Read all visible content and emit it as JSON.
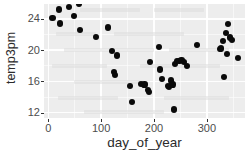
{
  "chart_data": {
    "type": "scatter",
    "title": "",
    "xlabel": "day_of_year",
    "ylabel": "temp3pm",
    "xlim": [
      -8,
      372
    ],
    "ylim": [
      11.3,
      25.9
    ],
    "xticks": [
      0,
      100,
      200,
      300
    ],
    "xtick_labels": [
      "0",
      "100",
      "200",
      "300"
    ],
    "yticks": [
      12,
      16,
      20,
      24
    ],
    "ytick_labels": [
      "12",
      "16",
      "20",
      "24"
    ],
    "grid": true,
    "grid_color": "#ffffff",
    "panel_background": "#ededed",
    "point_color": "#000000",
    "legend": null,
    "points": [
      {
        "x": 8,
        "y": 24.1
      },
      {
        "x": 20,
        "y": 25.2
      },
      {
        "x": 22,
        "y": 23.4
      },
      {
        "x": 40,
        "y": 25.5
      },
      {
        "x": 48,
        "y": 24.4
      },
      {
        "x": 58,
        "y": 25.9
      },
      {
        "x": 60,
        "y": 22.6
      },
      {
        "x": 90,
        "y": 21.7
      },
      {
        "x": 113,
        "y": 22.9
      },
      {
        "x": 120,
        "y": 19.9
      },
      {
        "x": 124,
        "y": 17.2
      },
      {
        "x": 126,
        "y": 16.8
      },
      {
        "x": 130,
        "y": 19.3
      },
      {
        "x": 155,
        "y": 15.4
      },
      {
        "x": 158,
        "y": 13.3
      },
      {
        "x": 175,
        "y": 15.7
      },
      {
        "x": 182,
        "y": 15.6
      },
      {
        "x": 188,
        "y": 14.9
      },
      {
        "x": 190,
        "y": 14.6
      },
      {
        "x": 193,
        "y": 18.5
      },
      {
        "x": 210,
        "y": 20.4
      },
      {
        "x": 212,
        "y": 17.5
      },
      {
        "x": 215,
        "y": 16.3
      },
      {
        "x": 226,
        "y": 15.4
      },
      {
        "x": 229,
        "y": 15.3
      },
      {
        "x": 232,
        "y": 16.1
      },
      {
        "x": 235,
        "y": 15.6
      },
      {
        "x": 238,
        "y": 12.4
      },
      {
        "x": 240,
        "y": 18.2
      },
      {
        "x": 244,
        "y": 18.6
      },
      {
        "x": 248,
        "y": 18.6
      },
      {
        "x": 252,
        "y": 18.7
      },
      {
        "x": 256,
        "y": 18.5
      },
      {
        "x": 262,
        "y": 18.0
      },
      {
        "x": 281,
        "y": 20.6
      },
      {
        "x": 324,
        "y": 20.1
      },
      {
        "x": 327,
        "y": 20.2
      },
      {
        "x": 330,
        "y": 21.2
      },
      {
        "x": 332,
        "y": 16.5
      },
      {
        "x": 336,
        "y": 22.2
      },
      {
        "x": 338,
        "y": 19.5
      },
      {
        "x": 340,
        "y": 23.3
      },
      {
        "x": 343,
        "y": 21.6
      },
      {
        "x": 348,
        "y": 21.3
      },
      {
        "x": 358,
        "y": 19.0
      }
    ]
  },
  "axes": {
    "y_title": "temp3pm",
    "x_title": "day_of_year"
  }
}
